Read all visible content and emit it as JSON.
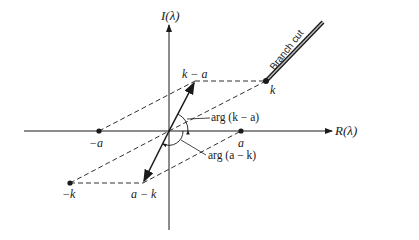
{
  "figure": {
    "axes": {
      "imag_label": "I(λ)",
      "real_label": "R(λ)"
    },
    "points": {
      "k": "k",
      "k_minus_a": "k − a",
      "neg_a": "−a",
      "a": "a",
      "neg_k": "−k",
      "a_minus_k": "a − k"
    },
    "angles": {
      "arg_k_minus_a": "arg (k − a)",
      "arg_a_minus_k": "arg (a − k)"
    },
    "branch_cut_label": "Branch cut",
    "colors": {
      "ink": "#1a1a1a",
      "branch_cut": "#555555"
    }
  }
}
